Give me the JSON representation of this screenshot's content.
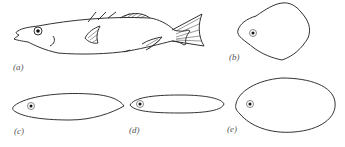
{
  "figure": {
    "panels": [
      {
        "id": "a",
        "label": "(a)",
        "description": "side view of fish"
      },
      {
        "id": "b",
        "label": "(b)",
        "description": "rounded rhombus cross-section with eye"
      },
      {
        "id": "c",
        "label": "(c)",
        "description": "tapered elongated cross-section with eye"
      },
      {
        "id": "d",
        "label": "(d)",
        "description": "narrow elongated cross-section with eye"
      },
      {
        "id": "e",
        "label": "(e)",
        "description": "oval cross-section with eye"
      }
    ],
    "colors": {
      "line": "#333333",
      "background": "#ffffff",
      "label": "#555555"
    }
  }
}
